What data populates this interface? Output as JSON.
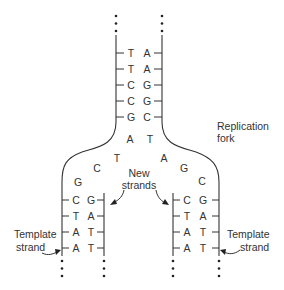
{
  "diagram": {
    "labels": {
      "replication_fork": [
        "Replication",
        "fork"
      ],
      "new_strands": [
        "New",
        "strands"
      ],
      "template_strand_left": [
        "Template",
        "strand"
      ],
      "template_strand_right": [
        "Template",
        "strand"
      ]
    },
    "parent_duplex": {
      "pairs": [
        {
          "left": "T",
          "right": "A"
        },
        {
          "left": "T",
          "right": "A"
        },
        {
          "left": "C",
          "right": "G"
        },
        {
          "left": "C",
          "right": "G"
        },
        {
          "left": "G",
          "right": "C"
        }
      ]
    },
    "unpaired_fork_bases": {
      "left_arm": [
        "A",
        "T",
        "C",
        "G"
      ],
      "right_arm": [
        "T",
        "A",
        "G",
        "C"
      ]
    },
    "left_daughter_duplex": {
      "pairs": [
        {
          "left": "C",
          "right": "G"
        },
        {
          "left": "T",
          "right": "A"
        },
        {
          "left": "A",
          "right": "T"
        },
        {
          "left": "A",
          "right": "T"
        }
      ]
    },
    "right_daughter_duplex": {
      "pairs": [
        {
          "left": "C",
          "right": "G"
        },
        {
          "left": "T",
          "right": "A"
        },
        {
          "left": "A",
          "right": "T"
        },
        {
          "left": "A",
          "right": "T"
        }
      ]
    },
    "continuation_marker": "⋮",
    "colors": {
      "ink": "#333333",
      "background": "#ffffff"
    }
  }
}
